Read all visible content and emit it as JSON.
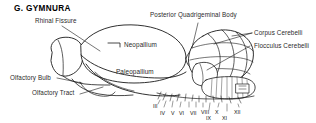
{
  "figure": {
    "title": "G. GYMNURA",
    "background_color": "#ffffff",
    "ink_color": "#1a1a1a",
    "view": "lateral brain illustration"
  },
  "callout_labels": [
    {
      "id": "rhinal-fissure",
      "text": "Rhinal Fissure"
    },
    {
      "id": "posterior-quadrigeminal-body",
      "text": "Posterior Quadrigeminal Body"
    },
    {
      "id": "corpus-cerebelli",
      "text": "Corpus Cerebelli"
    },
    {
      "id": "flocculus-cerebelli",
      "text": "Flocculus Cerebelli"
    },
    {
      "id": "olfactory-bulb",
      "text": "Olfactory Bulb"
    },
    {
      "id": "olfactory-tract",
      "text": "Olfactory Tract"
    }
  ],
  "region_labels": [
    {
      "id": "neopallium",
      "text": "Neopallium"
    },
    {
      "id": "paleopallium",
      "text": "Paleopallium"
    }
  ],
  "cranial_nerves": [
    {
      "id": "nerve-iii",
      "text": "III"
    },
    {
      "id": "nerve-iv",
      "text": "IV"
    },
    {
      "id": "nerve-v",
      "text": "V"
    },
    {
      "id": "nerve-vi",
      "text": "VI"
    },
    {
      "id": "nerve-vii",
      "text": "VII"
    },
    {
      "id": "nerve-viii",
      "text": "VIII"
    },
    {
      "id": "nerve-ix",
      "text": "IX"
    },
    {
      "id": "nerve-x",
      "text": "X"
    },
    {
      "id": "nerve-xi",
      "text": "XI"
    },
    {
      "id": "nerve-xii",
      "text": "XII"
    }
  ]
}
